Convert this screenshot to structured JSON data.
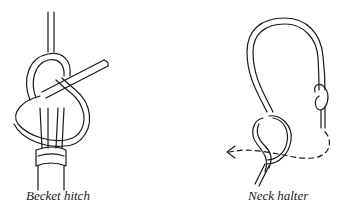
{
  "figures": [
    {
      "caption": "Becket hitch",
      "illustration": "becket-hitch-knot"
    },
    {
      "caption": "Neck halter",
      "illustration": "neck-halter-knot"
    }
  ],
  "colors": {
    "ink": "#1a1a1a",
    "background": "#ffffff"
  }
}
